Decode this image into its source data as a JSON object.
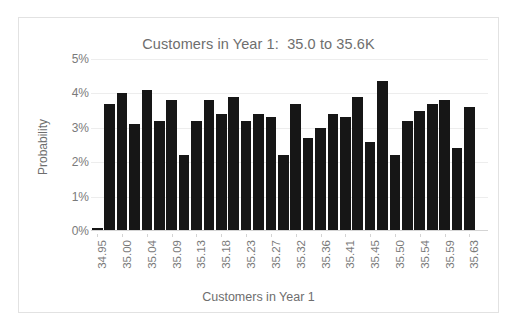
{
  "chart_data": {
    "type": "bar",
    "title": "Customers in Year 1:  35.0 to 35.6K",
    "xlabel": "Customers in Year 1",
    "ylabel": "Probability",
    "ylim": [
      0,
      5
    ],
    "ytick_labels": [
      "5%",
      "4%",
      "3%",
      "2%",
      "1%",
      "0%"
    ],
    "ytick_values": [
      5,
      4,
      3,
      2,
      1,
      0
    ],
    "grid": true,
    "legend": "none",
    "yunit": "percent",
    "x_tick_labels": [
      "34.95",
      "35.00",
      "35.04",
      "35.09",
      "35.13",
      "35.18",
      "35.23",
      "35.27",
      "35.32",
      "35.36",
      "35.41",
      "35.45",
      "35.50",
      "35.54",
      "35.59",
      "35.63"
    ],
    "x_tick_every": 2,
    "bar_color": "#161616",
    "highlight_color": "#a3a3a3",
    "highlight_index": 31,
    "categories": [
      "34.95",
      "34.97",
      "35.00",
      "35.02",
      "35.04",
      "35.06",
      "35.09",
      "35.11",
      "35.13",
      "35.15",
      "35.18",
      "35.20",
      "35.23",
      "35.25",
      "35.27",
      "35.29",
      "35.32",
      "35.34",
      "35.36",
      "35.38",
      "35.41",
      "35.43",
      "35.45",
      "35.47",
      "35.50",
      "35.52",
      "35.54",
      "35.56",
      "35.59",
      "35.61",
      "35.63",
      "35.65"
    ],
    "values": [
      0.1,
      3.7,
      4.0,
      3.1,
      4.1,
      3.2,
      3.8,
      2.2,
      3.2,
      3.8,
      3.4,
      3.9,
      3.2,
      3.4,
      3.3,
      2.2,
      3.7,
      2.7,
      3.0,
      3.4,
      3.3,
      3.9,
      2.6,
      4.35,
      2.2,
      3.2,
      3.5,
      3.7,
      3.8,
      2.4,
      3.6,
      0
    ]
  }
}
